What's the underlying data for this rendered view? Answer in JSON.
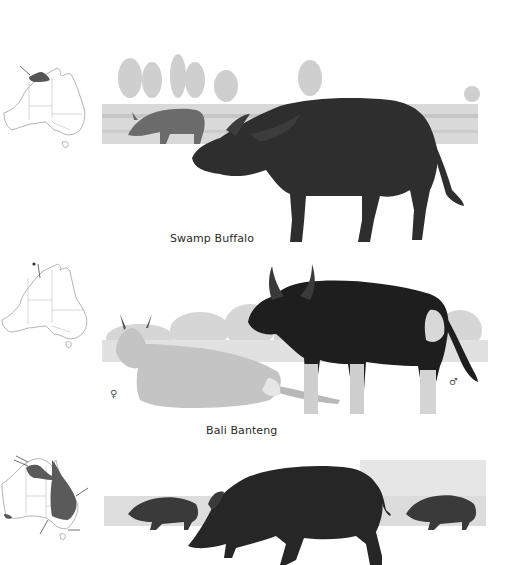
{
  "page": {
    "background": "#ffffff"
  },
  "species": [
    {
      "name": "Swamp Buffalo",
      "map": {
        "region": "Top End (northern Northern Territory)",
        "shaded": true,
        "shade_color": "#555555"
      },
      "illustration": {
        "subject": "swamp-buffalo",
        "background_scene": "wetland with trees",
        "secondary_animal": "grazing buffalo in water"
      }
    },
    {
      "name": "Bali Banteng",
      "map": {
        "region": "Cobourg Peninsula (small point)",
        "shaded": false,
        "shade_color": "#555555"
      },
      "illustration": {
        "subject": "bali-banteng",
        "background_scene": "grassland shrubs",
        "female_symbol": "♀",
        "male_symbol": "♂"
      }
    },
    {
      "name": "",
      "map": {
        "region": "eastern Australia & northern areas",
        "shaded": true,
        "shade_color": "#666666"
      },
      "illustration": {
        "subject": "feral-pig",
        "background_scene": "grass",
        "secondary_animal": "two piglets running"
      }
    }
  ],
  "colors": {
    "animal_dark": "#2b2b2b",
    "animal_mid": "#4a4a4a",
    "banteng_female": "#c9c9c9",
    "background_wash": "#d6d6d6",
    "map_outline": "#9a9a9a",
    "map_fill": "#555555"
  }
}
